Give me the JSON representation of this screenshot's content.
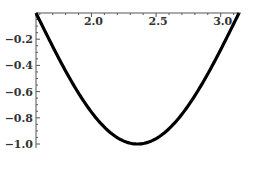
{
  "chart_data": {
    "type": "line",
    "title": "",
    "xlabel": "",
    "ylabel": "",
    "function": "sin(2x)",
    "xlim": [
      1.5708,
      3.1416
    ],
    "ylim": [
      -1.0,
      0.0
    ],
    "grid": false,
    "legend": null,
    "x_ticks": [
      2.0,
      2.5,
      3.0
    ],
    "x_tick_labels": [
      "2.0",
      "2.5",
      "3.0"
    ],
    "y_ticks": [
      -0.2,
      -0.4,
      -0.6,
      -0.8,
      -1.0
    ],
    "y_tick_labels": [
      "-0.2",
      "-0.4",
      "-0.6",
      "-0.8",
      "-1.0"
    ],
    "series": [
      {
        "name": "sin(2x)",
        "color": "#000000",
        "x": [
          1.5708,
          1.7,
          1.8,
          1.9,
          2.0,
          2.1,
          2.2,
          2.3,
          2.3562,
          2.4,
          2.5,
          2.6,
          2.7,
          2.8,
          2.9,
          3.0,
          3.1,
          3.1416
        ],
        "y": [
          0.0,
          -0.256,
          -0.443,
          -0.612,
          -0.757,
          -0.872,
          -0.952,
          -0.994,
          -1.0,
          -0.996,
          -0.959,
          -0.883,
          -0.773,
          -0.631,
          -0.465,
          -0.279,
          -0.083,
          0.0
        ]
      }
    ]
  },
  "axis": {
    "x_labels": [
      "2.0",
      "2.5",
      "3.0"
    ],
    "y_labels": [
      "-0.2",
      "-0.4",
      "-0.6",
      "-0.8",
      "-1.0"
    ]
  }
}
